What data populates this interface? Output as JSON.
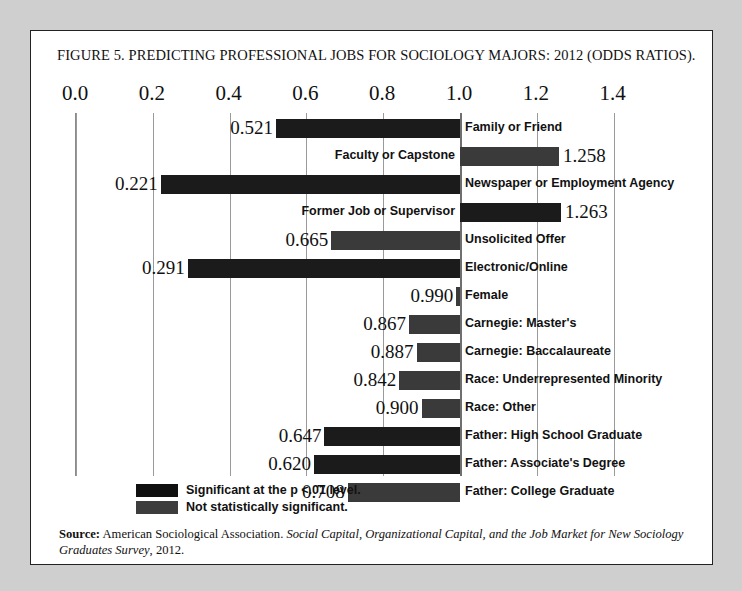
{
  "figure": {
    "title_prefix": "Figure 5.",
    "title_main": "Predicting Professional Jobs for Sociology Majors: 2012 (Odds Ratios).",
    "title_full": "FIGURE 5. PREDICTING PROFESSIONAL JOBS FOR SOCIOLOGY MAJORS: 2012 (ODDS RATIOS)."
  },
  "chart_data": {
    "type": "bar",
    "orientation": "horizontal",
    "title": "Figure 5. Predicting Professional Jobs for Sociology Majors: 2012 (Odds Ratios).",
    "xlabel": "",
    "ylabel": "",
    "xlim": [
      0.0,
      1.4
    ],
    "baseline": 1.0,
    "grid": true,
    "xticks": [
      "0.0",
      "0.2",
      "0.4",
      "0.6",
      "0.8",
      "1.0",
      "1.2",
      "1.4"
    ],
    "xtick_values": [
      0.0,
      0.2,
      0.4,
      0.6,
      0.8,
      1.0,
      1.2,
      1.4
    ],
    "legend_position": "below-plot",
    "categories": [
      "Family or Friend",
      "Faculty or Capstone",
      "Newspaper or Employment Agency",
      "Former Job or Supervisor",
      "Unsolicited Offer",
      "Electronic/Online",
      "Female",
      "Carnegie: Master's",
      "Carnegie: Baccalaureate",
      "Race: Underrepresented Minority",
      "Race: Other",
      "Father: High School Graduate",
      "Father: Associate's Degree",
      "Father: College Graduate"
    ],
    "values": [
      0.521,
      1.258,
      0.221,
      1.263,
      0.665,
      0.291,
      0.99,
      0.867,
      0.887,
      0.842,
      0.9,
      0.647,
      0.62,
      0.708
    ],
    "value_labels": [
      "0.521",
      "1.258",
      "0.221",
      "1.263",
      "0.665",
      "0.291",
      "0.990",
      "0.867",
      "0.887",
      "0.842",
      "0.900",
      "0.647",
      "0.620",
      "0.708"
    ],
    "significance": [
      "sig",
      "nonsig",
      "sig",
      "sig",
      "nonsig",
      "sig",
      "nonsig",
      "nonsig",
      "nonsig",
      "nonsig",
      "nonsig",
      "sig",
      "sig",
      "nonsig"
    ],
    "legend": [
      {
        "label": "Significant at the p <.01 level.",
        "key": "sig"
      },
      {
        "label": "Not statistically significant.",
        "key": "nonsig"
      }
    ]
  },
  "source": {
    "prefix": "Source:",
    "org": " American Sociological Association. ",
    "italic_title": "Social Capital, Organizational Capital, and the Job Market for New Sociology Graduates Survey",
    "suffix": ", 2012."
  },
  "colors": {
    "bar_significant": "#1b1b1b",
    "bar_not_significant": "#3a3a3a",
    "grid": "#9a9a9a",
    "text": "#111111",
    "page_background": "#cfcfcf",
    "figure_background": "#ffffff"
  }
}
